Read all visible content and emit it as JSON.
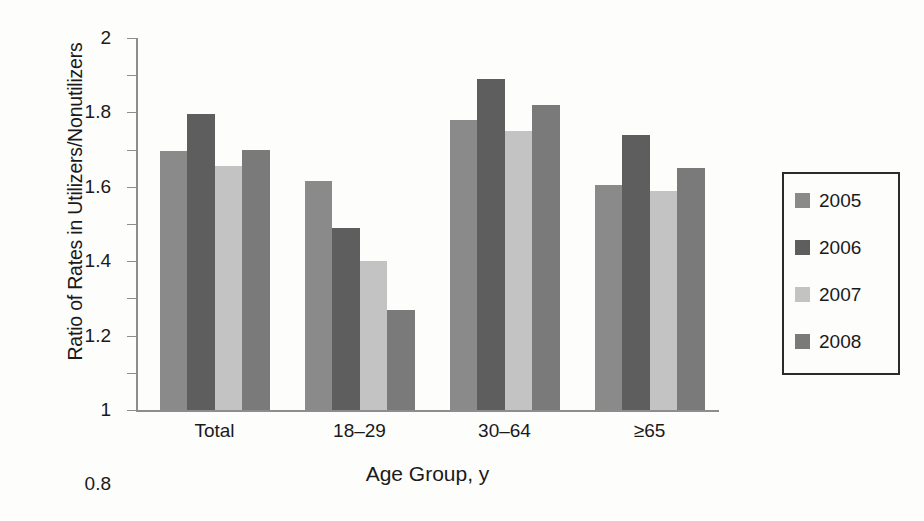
{
  "chart_data": {
    "type": "bar",
    "title": "",
    "subtitle": "",
    "xlabel": "Age Group, y",
    "ylabel": "Ratio of Rates in Utilizers/Nonutilizers",
    "categories": [
      "Total",
      "18–29",
      "30–64",
      "≥65"
    ],
    "series": [
      {
        "name": "2005",
        "color": "#8a8a8a",
        "values": [
          1.39,
          1.23,
          1.56,
          1.21
        ]
      },
      {
        "name": "2006",
        "color": "#5e5e5e",
        "values": [
          1.59,
          0.98,
          1.78,
          1.48
        ]
      },
      {
        "name": "2007",
        "color": "#c3c3c3",
        "values": [
          1.31,
          0.8,
          1.5,
          1.18
        ]
      },
      {
        "name": "2008",
        "color": "#7a7a7a",
        "values": [
          1.4,
          0.54,
          1.64,
          1.3
        ]
      }
    ],
    "ylim": [
      0,
      2
    ],
    "ytick_step": 0.2,
    "yticks": [
      "0",
      "0.2",
      "0.4",
      "0.6",
      "0.8",
      "1",
      "1.2",
      "1.4",
      "1.6",
      "1.8",
      "2"
    ],
    "grid": false,
    "legend_position": "right"
  },
  "legend": {
    "entries": [
      {
        "label": "2005"
      },
      {
        "label": "2006"
      },
      {
        "label": "2007"
      },
      {
        "label": "2008"
      }
    ]
  }
}
